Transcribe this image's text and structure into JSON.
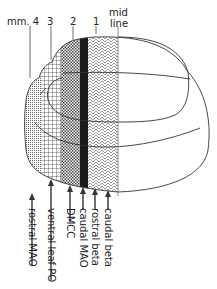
{
  "diagram": {
    "type": "anatomical zone map (brain section)",
    "top_labels": {
      "mm4": "mm. 4",
      "z3": "3",
      "z2": "2",
      "z1": "1",
      "midline_1": "mid",
      "midline_2": "line"
    },
    "zones": [
      {
        "id": "4",
        "pattern": "fine-stipple",
        "label": "rostral MAO"
      },
      {
        "id": "3",
        "pattern": "grid",
        "label": "ventral leaf PO"
      },
      {
        "id": "2",
        "pattern": "checker",
        "label": "DMCC"
      },
      {
        "id": "black",
        "pattern": "solid-black",
        "label": "caudal MAO"
      },
      {
        "id": "1",
        "pattern": "chevron",
        "label": "rostral beta"
      },
      {
        "id": "midline",
        "pattern": "none",
        "label": "caudal beta"
      }
    ],
    "arrow_labels": {
      "a1": "rostral MAO",
      "a2": "ventral leaf PO",
      "a3": "DMCC",
      "a4": "caudal MAO",
      "a5": "rostral beta",
      "a6": "caudal beta"
    },
    "colors": {
      "ink": "#333333",
      "black_band": "#1a1a1a",
      "background": "#ffffff"
    }
  }
}
